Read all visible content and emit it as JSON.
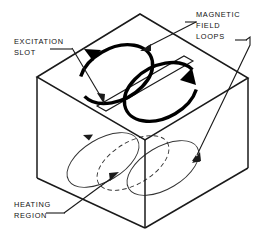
{
  "figure": {
    "title": "Magnetic field loops and heating region in an excitation slot cavity",
    "background_color": "#ffffff",
    "line_color": "#1a1a1a",
    "loop_color": "#000000",
    "thin_loop_color": "#333333"
  },
  "labels": {
    "magnetic_field_loops": {
      "line1": "MAGNETIC",
      "line2": "FIELD",
      "line3": "LOOPS"
    },
    "excitation_slot": {
      "line1": "EXCITATION",
      "line2": "SLOT"
    },
    "heating_region": {
      "line1": "HEATING",
      "line2": "REGION"
    }
  },
  "parts": {
    "enclosure": "rectangular-box",
    "top_face": "top-face",
    "front_face": "front-face",
    "right_face": "right-face",
    "slot": "excitation-slot",
    "upper_loop_left": "magnetic-field-loop-left",
    "upper_loop_right": "magnetic-field-loop-right",
    "lower_loop_left": "heating-region-loop-left",
    "lower_loop_right": "heating-region-loop-right",
    "lower_loop_center": "heating-region-loop-center-hidden"
  }
}
